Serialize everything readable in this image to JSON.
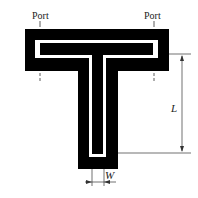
{
  "diagram": {
    "type": "T-junction resonator layout",
    "colors": {
      "substrate": "#000000",
      "slot": "#ffffff",
      "background": "#ffffff",
      "annotation": "#333333"
    },
    "labels": {
      "port_left": "Port",
      "port_right": "Port",
      "length": "L",
      "width": "W"
    },
    "dimensions": [
      {
        "name": "L",
        "orientation": "vertical",
        "description": "stub length from top-bar slot to stub bottom"
      },
      {
        "name": "W",
        "orientation": "horizontal",
        "description": "stub slot width"
      }
    ],
    "ports": [
      {
        "label": "Port",
        "position": "left"
      },
      {
        "label": "Port",
        "position": "right"
      }
    ]
  }
}
